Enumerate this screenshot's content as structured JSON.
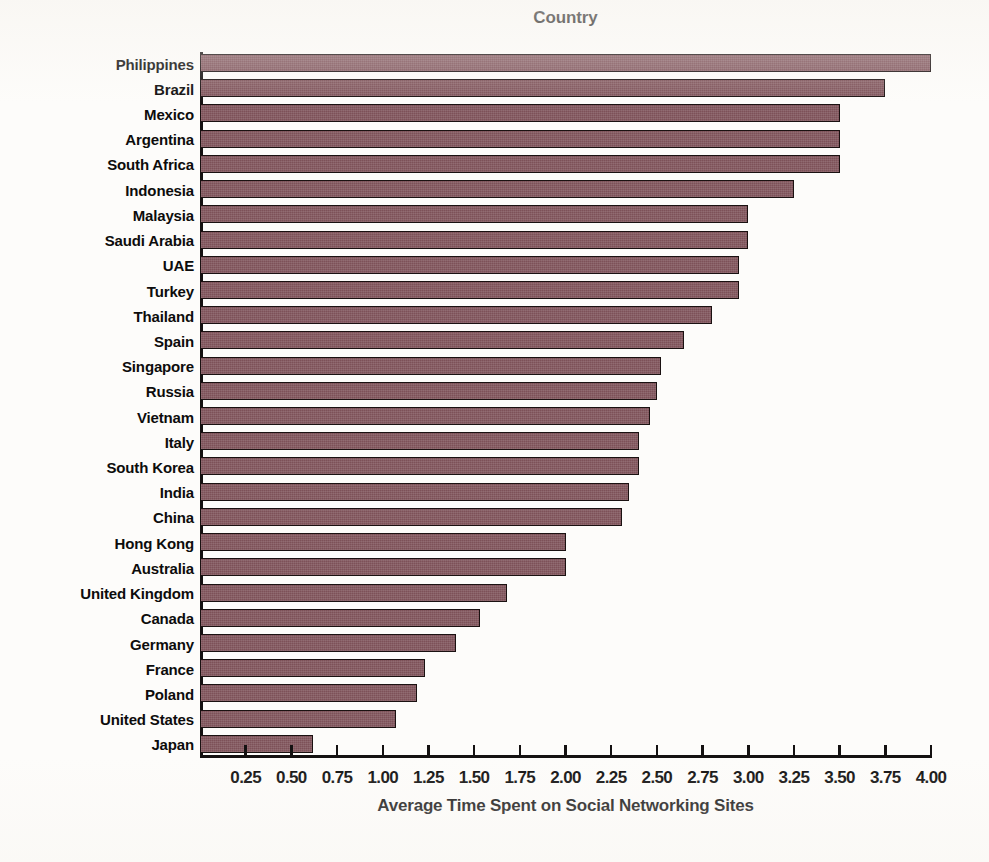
{
  "chart_data": {
    "type": "bar",
    "orientation": "horizontal",
    "title": "Country",
    "xlabel": "Average Time Spent on Social Networking Sites",
    "ylabel": "",
    "xlim": [
      0,
      4.0
    ],
    "xticks": [
      "0.25",
      "0.50",
      "0.75",
      "1.00",
      "1.25",
      "1.50",
      "1.75",
      "2.00",
      "2.25",
      "2.50",
      "2.75",
      "3.00",
      "3.25",
      "3.50",
      "3.75",
      "4.00"
    ],
    "xtick_values": [
      0.25,
      0.5,
      0.75,
      1.0,
      1.25,
      1.5,
      1.75,
      2.0,
      2.25,
      2.5,
      2.75,
      3.0,
      3.25,
      3.5,
      3.75,
      4.0
    ],
    "grid": false,
    "legend": null,
    "bar_color": "#7d5158",
    "bar_edge_color": "#1a1111",
    "categories": [
      "Philippines",
      "Brazil",
      "Mexico",
      "Argentina",
      "South Africa",
      "Indonesia",
      "Malaysia",
      "Saudi Arabia",
      "UAE",
      "Turkey",
      "Thailand",
      "Spain",
      "Singapore",
      "Russia",
      "Vietnam",
      "Italy",
      "South Korea",
      "India",
      "China",
      "Hong Kong",
      "Australia",
      "United Kingdom",
      "Canada",
      "Germany",
      "France",
      "Poland",
      "United States",
      "Japan"
    ],
    "values": [
      4.0,
      3.75,
      3.5,
      3.5,
      3.5,
      3.25,
      3.0,
      3.0,
      2.95,
      2.95,
      2.8,
      2.65,
      2.52,
      2.5,
      2.46,
      2.4,
      2.4,
      2.35,
      2.31,
      2.0,
      2.0,
      1.68,
      1.53,
      1.4,
      1.23,
      1.19,
      1.07,
      0.62
    ]
  }
}
